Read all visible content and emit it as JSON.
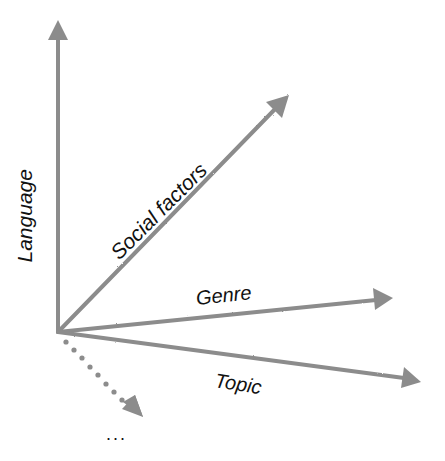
{
  "diagram": {
    "type": "vector-axes",
    "origin": [
      58,
      332
    ],
    "arrow_color": "#8c8c8c",
    "text_color": "#111111",
    "axes": [
      {
        "id": "language",
        "label": "Language",
        "tip": [
          58,
          22
        ],
        "style": "solid"
      },
      {
        "id": "social-factors",
        "label": "Social factors",
        "tip": [
          288,
          96
        ],
        "style": "solid"
      },
      {
        "id": "genre",
        "label": "Genre",
        "tip": [
          392,
          298
        ],
        "style": "solid"
      },
      {
        "id": "topic",
        "label": "Topic",
        "tip": [
          420,
          382
        ],
        "style": "solid"
      },
      {
        "id": "more",
        "label": "...",
        "tip": [
          142,
          416
        ],
        "style": "dotted"
      }
    ]
  },
  "labels": {
    "language": "Language",
    "social_factors": "Social factors",
    "genre": "Genre",
    "topic": "Topic",
    "more": "..."
  }
}
